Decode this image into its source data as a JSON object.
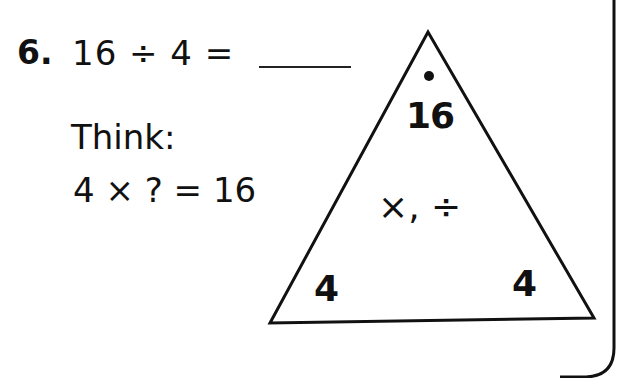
{
  "problem": {
    "number": "6.",
    "equation": "16 ÷ 4 =",
    "answer": "",
    "think_label": "Think:",
    "think_equation": "4 × ? = 16"
  },
  "fact_triangle": {
    "top": "16",
    "bottom_left": "4",
    "bottom_right": "4",
    "operations": "×, ÷"
  },
  "colors": {
    "ink": "#111111",
    "background": "#ffffff"
  }
}
